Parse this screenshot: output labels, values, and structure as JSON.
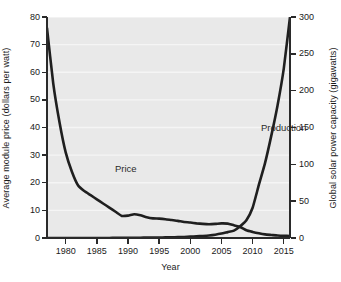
{
  "chart_data": {
    "type": "line",
    "title": "",
    "xlabel": "Year",
    "xlim": [
      1977,
      2016
    ],
    "xticks": [
      1980,
      1985,
      1990,
      1995,
      2000,
      2005,
      2010,
      2015
    ],
    "grid": true,
    "grid_orientation": "horizontal",
    "legend_position": "inline-annotations",
    "axes": [
      {
        "side": "left",
        "label": "Average module price (dollars per watt)",
        "ylim": [
          0,
          80
        ],
        "yticks": [
          0,
          10,
          20,
          30,
          40,
          50,
          60,
          70,
          80
        ]
      },
      {
        "side": "right",
        "label": "Global solar power capacity (gigawatts)",
        "ylim": [
          0,
          300
        ],
        "yticks": [
          0,
          50,
          100,
          150,
          200,
          250,
          300
        ]
      }
    ],
    "series": [
      {
        "name": "Price",
        "axis": "left",
        "unit": "dollars per watt",
        "annotation": "Price",
        "color": "#1f1f1f",
        "x": [
          1977,
          1978,
          1979,
          1980,
          1981,
          1982,
          1983,
          1984,
          1985,
          1986,
          1987,
          1988,
          1989,
          1990,
          1991,
          1992,
          1993,
          1994,
          1995,
          1996,
          1997,
          1998,
          1999,
          2000,
          2001,
          2002,
          2003,
          2004,
          2005,
          2006,
          2007,
          2008,
          2009,
          2010,
          2011,
          2012,
          2013,
          2014,
          2015,
          2016
        ],
        "values": [
          76.0,
          56.0,
          42.0,
          31.0,
          24.0,
          19.0,
          17.0,
          15.5,
          14.0,
          12.5,
          11.0,
          9.5,
          8.0,
          8.1,
          8.6,
          8.2,
          7.5,
          7.1,
          7.0,
          6.8,
          6.5,
          6.2,
          5.8,
          5.6,
          5.3,
          5.1,
          5.0,
          5.1,
          5.3,
          5.2,
          4.6,
          4.0,
          2.8,
          2.2,
          1.7,
          1.3,
          1.1,
          0.9,
          0.8,
          0.75
        ]
      },
      {
        "name": "Production",
        "axis": "right",
        "unit": "gigawatts",
        "annotation": "Production",
        "color": "#1f1f1f",
        "x": [
          1977,
          1978,
          1979,
          1980,
          1981,
          1982,
          1983,
          1984,
          1985,
          1986,
          1987,
          1988,
          1989,
          1990,
          1991,
          1992,
          1993,
          1994,
          1995,
          1996,
          1997,
          1998,
          1999,
          2000,
          2001,
          2002,
          2003,
          2004,
          2005,
          2006,
          2007,
          2008,
          2009,
          2010,
          2011,
          2012,
          2013,
          2014,
          2015,
          2016
        ],
        "values": [
          0.0,
          0.0,
          0.0,
          0.0,
          0.0,
          0.0,
          0.0,
          0.0,
          0.1,
          0.1,
          0.1,
          0.2,
          0.2,
          0.3,
          0.3,
          0.4,
          0.5,
          0.6,
          0.7,
          0.8,
          1.0,
          1.2,
          1.4,
          1.8,
          2.2,
          2.8,
          3.5,
          4.5,
          6.0,
          8.0,
          10.0,
          16.0,
          24.0,
          41.0,
          72.0,
          102.0,
          139.0,
          180.0,
          230.0,
          300.0
        ]
      }
    ]
  },
  "annotations": {
    "price_label": "Price",
    "production_label": "Production"
  },
  "axis_titles": {
    "left": "Average module price (dollars per watt)",
    "right": "Global solar power capacity (gigawatts)",
    "bottom": "Year"
  },
  "colors": {
    "plot_background": "#e9e9e9",
    "gridline": "#f5f5f5",
    "line": "#1f1f1f",
    "axis": "#2a2a2a",
    "text": "#1a1a1a",
    "page_background": "#ffffff"
  }
}
